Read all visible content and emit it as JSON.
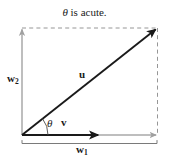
{
  "figure": {
    "title": "θ is acute.",
    "title_symbol": "θ",
    "title_rest": " is acute.",
    "labels": {
      "u": "u",
      "v": "v",
      "theta": "θ",
      "w1_base": "w",
      "w1_sub": "1",
      "w2_base": "w",
      "w2_sub": "2"
    },
    "colors": {
      "vector_u": "#1a1a1a",
      "vector_v": "#1a1a1a",
      "component_w1": "#a8a8a8",
      "component_w2": "#a8a8a8",
      "dashed_guide": "#8a8a8a",
      "brace": "#7a7a7a",
      "text": "#1a1a1a",
      "background": "#ffffff"
    },
    "geometry": {
      "origin": [
        22,
        135
      ],
      "u_tip": [
        157,
        28
      ],
      "w1_tip": [
        157,
        135
      ],
      "w2_tip": [
        22,
        28
      ],
      "v_tip": [
        99,
        135
      ],
      "theta_arc_radius": 26,
      "theta_degrees": 38
    }
  }
}
